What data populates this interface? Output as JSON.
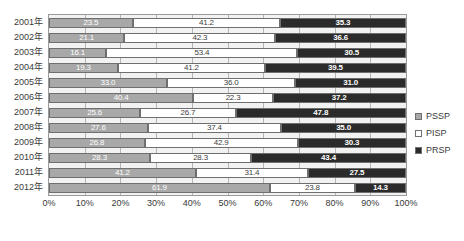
{
  "chart_data": {
    "type": "bar",
    "orientation": "horizontal",
    "stacked": true,
    "stack_total": 100,
    "title": "",
    "subtitle": "",
    "xlabel": "",
    "ylabel": "",
    "xlim": [
      0,
      100
    ],
    "xticks": [
      "0%",
      "10%",
      "20%",
      "30%",
      "40%",
      "50%",
      "60%",
      "70%",
      "80%",
      "90%",
      "100%"
    ],
    "xtick_values": [
      0,
      10,
      20,
      30,
      40,
      50,
      60,
      70,
      80,
      90,
      100
    ],
    "grid": true,
    "legend_position": "right",
    "categories": [
      "2001年",
      "2002年",
      "2003年",
      "2004年",
      "2005年",
      "2006年",
      "2007年",
      "2008年",
      "2009年",
      "2010年",
      "2011年",
      "2012年"
    ],
    "series": [
      {
        "name": "PSSP",
        "color": "#a8a8a8",
        "values": [
          23.5,
          21.1,
          16.1,
          19.3,
          33.0,
          40.4,
          25.6,
          27.6,
          26.8,
          28.3,
          41.2,
          61.9
        ],
        "labels": [
          "23.5",
          "21.1",
          "16.1",
          "19.3",
          "33.0",
          "40.4",
          "25.6",
          "27.6",
          "26.8",
          "28.3",
          "41.2",
          "61.9"
        ]
      },
      {
        "name": "PISP",
        "color": "#ffffff",
        "values": [
          41.2,
          42.3,
          53.4,
          41.2,
          36.0,
          22.3,
          26.7,
          37.4,
          42.9,
          28.3,
          31.4,
          23.8
        ],
        "labels": [
          "41.2",
          "42.3",
          "53.4",
          "41.2",
          "36.0",
          "22.3",
          "26.7",
          "37.4",
          "42.9",
          "28.3",
          "31.4",
          "23.8"
        ]
      },
      {
        "name": "PRSP",
        "color": "#2b2b2b",
        "values": [
          35.3,
          36.6,
          30.5,
          39.5,
          31.0,
          37.2,
          47.8,
          35.0,
          30.3,
          43.4,
          27.5,
          14.3
        ],
        "labels": [
          "35.3",
          "36.6",
          "30.5",
          "39.5",
          "31.0",
          "37.2",
          "47.8",
          "35.0",
          "30.3",
          "43.4",
          "27.5",
          "14.3"
        ]
      }
    ]
  },
  "legend": {
    "items": [
      {
        "label": "PSSP",
        "swatch": "pssp"
      },
      {
        "label": "PISP",
        "swatch": "pisp"
      },
      {
        "label": "PRSP",
        "swatch": "prsp"
      }
    ]
  }
}
